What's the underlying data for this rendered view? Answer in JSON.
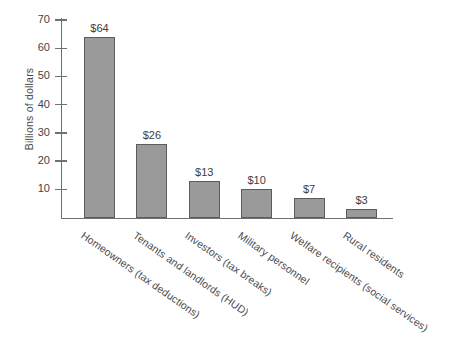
{
  "chart_data": {
    "type": "bar",
    "title": "",
    "subtitle": "",
    "xlabel": "",
    "ylabel": "Billions of dollars",
    "ylim": [
      0,
      72
    ],
    "yticks": [
      10,
      20,
      30,
      40,
      50,
      60,
      70
    ],
    "ytick_labels": [
      "10",
      "20",
      "30",
      "40",
      "50",
      "60",
      "70"
    ],
    "grid": false,
    "legend": null,
    "orientation": "vertical",
    "categories": [
      "Homeowners (tax deductions)",
      "Tenants and landlords (HUD)",
      "Investors (tax breaks)",
      "Military personnel",
      "Welfare recipients (social services)",
      "Rural residents"
    ],
    "values": [
      64,
      26,
      13,
      10,
      7,
      3
    ],
    "value_labels": [
      "$64",
      "$26",
      "$13",
      "$10",
      "$7",
      "$3"
    ],
    "bar_color": "#9a9a9a",
    "bar_border_color": "#5c5c5c",
    "axis_color": "#707070",
    "background_color": "#ffffff",
    "label_rotation_degrees": -35
  }
}
